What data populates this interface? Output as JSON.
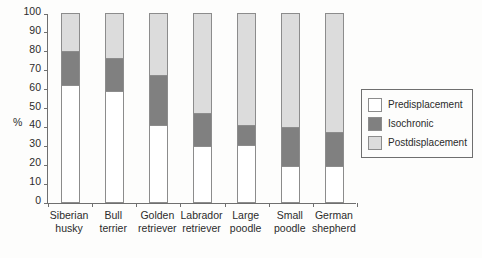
{
  "chart_data": {
    "type": "bar",
    "subtype": "stacked-percentage",
    "title": "",
    "xlabel": "",
    "ylabel": "%",
    "ylim": [
      0,
      100
    ],
    "yticks": [
      0,
      10,
      20,
      30,
      40,
      50,
      60,
      70,
      80,
      90,
      100
    ],
    "grid": false,
    "legend_position": "right",
    "categories": [
      "Siberian husky",
      "Bull terrier",
      "Golden retriever",
      "Labrador retriever",
      "Large poodle",
      "Small poodle",
      "German shepherd"
    ],
    "category_lines": [
      [
        "Siberian",
        "husky"
      ],
      [
        "Bull",
        "terrier"
      ],
      [
        "Golden",
        "retriever"
      ],
      [
        "Labrador",
        "retriever"
      ],
      [
        "Large",
        "poodle"
      ],
      [
        "Small",
        "poodle"
      ],
      [
        "German",
        "shepherd"
      ]
    ],
    "series": [
      {
        "name": "Predisplacement",
        "color": "#ffffff",
        "values": [
          62,
          58.5,
          41,
          29.5,
          30,
          19,
          19
        ]
      },
      {
        "name": "Isochronic",
        "color": "#808080",
        "values": [
          18,
          17.5,
          26,
          17.5,
          11,
          20.5,
          18
        ]
      },
      {
        "name": "Postdisplacement",
        "color": "#dcdcdc",
        "values": [
          20,
          24,
          33,
          53,
          59,
          60.5,
          63
        ]
      }
    ],
    "cumulative_tops": {
      "Predisplacement": [
        62,
        58.5,
        41,
        29.5,
        30,
        19,
        19
      ],
      "Isochronic": [
        80,
        76,
        67,
        47,
        41,
        39.5,
        37
      ],
      "Postdisplacement": [
        100,
        100,
        100,
        100,
        100,
        100,
        100
      ]
    }
  },
  "legend": {
    "items": [
      {
        "label": "Predisplacement",
        "color": "#ffffff"
      },
      {
        "label": "Isochronic",
        "color": "#808080"
      },
      {
        "label": "Postdisplacement",
        "color": "#dcdcdc"
      }
    ]
  },
  "axis": {
    "y_title": "%",
    "y_tick_labels": [
      "100",
      "90",
      "80",
      "70",
      "60",
      "50",
      "40",
      "30",
      "20",
      "10",
      "0"
    ]
  },
  "colors": {
    "page_background": "#e8e6e3",
    "figure_background": "#fdfdfc",
    "axis": "#6f6f6f",
    "bar_outline": "#8c8c8c",
    "text": "#2b2b2b"
  }
}
